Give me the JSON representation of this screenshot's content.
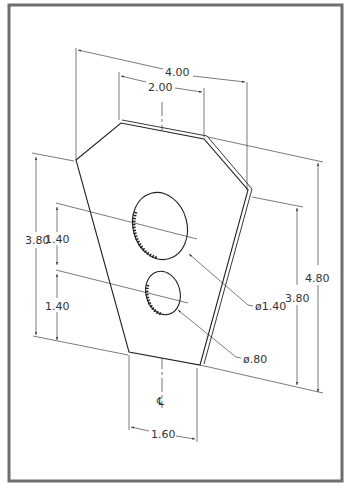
{
  "drawing": {
    "type": "isometric dimensioned part drawing",
    "frame_color": "#6e6e6e",
    "line_color": "#222222",
    "dimensions": {
      "overall_width": "4.00",
      "top_width": "2.00",
      "left_height": "3.80",
      "hole_spacing_upper": "1.40",
      "hole_spacing_lower": "1.40",
      "right_height_outer": "4.80",
      "right_height_inner": "3.80",
      "bottom_width": "1.60"
    },
    "callouts": {
      "large_hole": "ø1.40",
      "small_hole": "ø.80"
    },
    "centerline_symbol": "℄"
  }
}
